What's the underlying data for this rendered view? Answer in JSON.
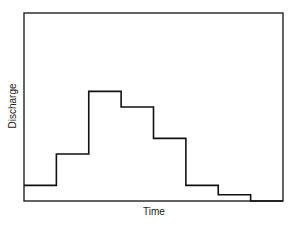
{
  "chart_data": {
    "type": "bar",
    "subtype": "step-hydrograph",
    "title": "",
    "xlabel": "Time",
    "ylabel": "Discharge",
    "categories": [
      "t1",
      "t2",
      "t3",
      "t4",
      "t5",
      "t6",
      "t7",
      "t8"
    ],
    "values": [
      1.0,
      3.0,
      7.0,
      6.0,
      4.0,
      1.0,
      0.4,
      0.0
    ],
    "ylim": [
      0,
      12
    ],
    "grid": false,
    "legend": null,
    "ticks": false
  },
  "labels": {
    "xlabel": "Time",
    "ylabel": "Discharge"
  }
}
